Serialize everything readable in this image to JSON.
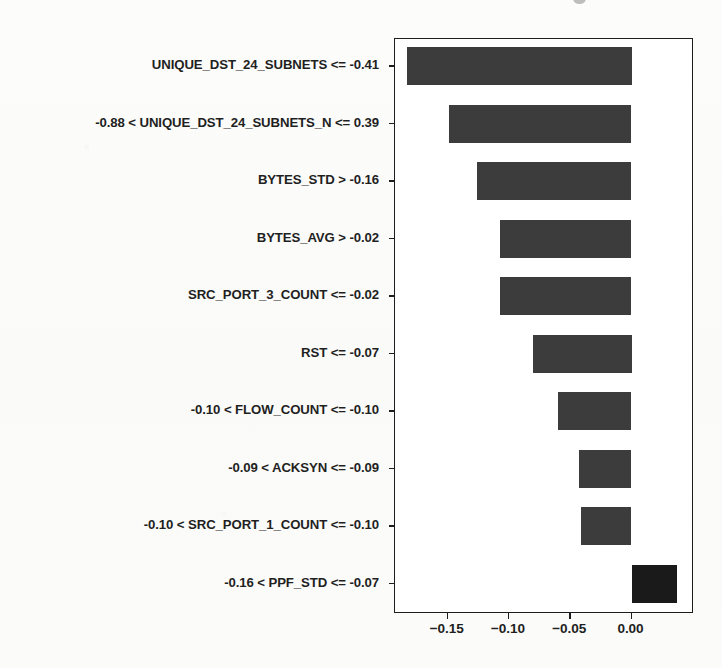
{
  "chart_data": {
    "type": "bar",
    "orientation": "horizontal",
    "title": "",
    "xlabel": "",
    "ylabel": "",
    "xlim": [
      -0.193,
      0.051
    ],
    "xticks": [
      -0.15,
      -0.1,
      -0.05,
      0.0
    ],
    "xtick_labels": [
      "−0.15",
      "−0.10",
      "−0.05",
      "0.00"
    ],
    "grid": false,
    "legend": false,
    "categories": [
      "UNIQUE_DST_24_SUBNETS <= -0.41",
      "-0.88 < UNIQUE_DST_24_SUBNETS_N <= 0.39",
      "BYTES_STD > -0.16",
      "BYTES_AVG > -0.02",
      "SRC_PORT_3_COUNT <= -0.02",
      "RST <= -0.07",
      "-0.10 < FLOW_COUNT <= -0.10",
      "-0.09 < ACKSYN <= -0.09",
      "-0.10 < SRC_PORT_1_COUNT <= -0.10",
      "-0.16 < PPF_STD <= -0.07"
    ],
    "values": [
      -0.183,
      -0.149,
      -0.126,
      -0.107,
      -0.107,
      -0.08,
      -0.06,
      -0.043,
      -0.041,
      0.037
    ],
    "bar_colors": [
      "#3c3c3c",
      "#3c3c3c",
      "#3c3c3c",
      "#3c3c3c",
      "#3c3c3c",
      "#3c3c3c",
      "#3c3c3c",
      "#3c3c3c",
      "#3c3c3c",
      "#1a1a1a"
    ],
    "axis_color": "#1d1d1d",
    "plot_background": "#ffffff",
    "figure_background": "#fbfbfa"
  }
}
